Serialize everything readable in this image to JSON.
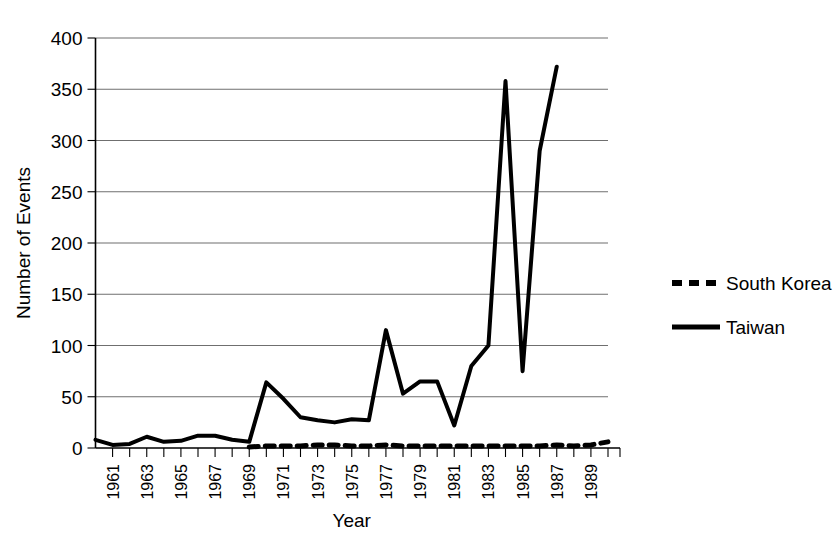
{
  "chart_data": {
    "type": "line",
    "title": "",
    "xlabel": "Year",
    "ylabel": "Number of Events",
    "xlim": [
      1960,
      1990
    ],
    "ylim": [
      0,
      400
    ],
    "yticks": [
      0,
      50,
      100,
      150,
      200,
      250,
      300,
      350,
      400
    ],
    "ytick_labels": [
      "0",
      "50",
      "100",
      "150",
      "200",
      "250",
      "300",
      "350",
      "400"
    ],
    "xticks": [
      1961,
      1963,
      1965,
      1967,
      1969,
      1971,
      1973,
      1975,
      1977,
      1979,
      1981,
      1983,
      1985,
      1987,
      1989
    ],
    "xtick_labels": [
      "1961",
      "1963",
      "1965",
      "1967",
      "1969",
      "1971",
      "1973",
      "1975",
      "1977",
      "1979",
      "1981",
      "1983",
      "1985",
      "1987",
      "1989"
    ],
    "x": [
      1960,
      1961,
      1962,
      1963,
      1964,
      1965,
      1966,
      1967,
      1968,
      1969,
      1970,
      1971,
      1972,
      1973,
      1974,
      1975,
      1976,
      1977,
      1978,
      1979,
      1980,
      1981,
      1982,
      1983,
      1984,
      1985,
      1986,
      1987
    ],
    "grid": "horizontal",
    "legend_position": "right",
    "series": [
      {
        "name": "Taiwan",
        "style": "solid",
        "color": "#000000",
        "x": [
          1960,
          1961,
          1962,
          1963,
          1964,
          1965,
          1966,
          1967,
          1968,
          1969,
          1970,
          1971,
          1972,
          1973,
          1974,
          1975,
          1976,
          1977,
          1978,
          1979,
          1980,
          1981,
          1982,
          1983,
          1984,
          1985,
          1986,
          1987
        ],
        "values": [
          8,
          3,
          4,
          11,
          6,
          7,
          12,
          12,
          8,
          6,
          64,
          48,
          30,
          27,
          25,
          28,
          27,
          115,
          53,
          65,
          65,
          22,
          80,
          100,
          358,
          75,
          290,
          372
        ]
      },
      {
        "name": "South Korea",
        "style": "dashed",
        "color": "#000000",
        "x": [
          1969,
          1970,
          1971,
          1972,
          1973,
          1974,
          1975,
          1976,
          1977,
          1978,
          1979,
          1980,
          1981,
          1982,
          1983,
          1984,
          1985,
          1986,
          1987,
          1988,
          1989,
          1990
        ],
        "values": [
          1,
          2,
          2,
          2,
          3,
          3,
          2,
          2,
          3,
          2,
          2,
          2,
          2,
          2,
          2,
          2,
          2,
          2,
          3,
          2,
          3,
          6
        ]
      }
    ],
    "legend": [
      {
        "label": "South Korea",
        "style": "dashed"
      },
      {
        "label": "Taiwan",
        "style": "solid"
      }
    ]
  }
}
